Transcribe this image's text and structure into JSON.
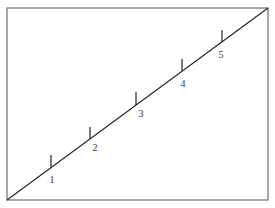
{
  "diagram": {
    "type": "number-line-diagonal",
    "frame": {
      "x": 7,
      "y": 8,
      "width": 261,
      "height": 192,
      "stroke": "#6e6e6e"
    },
    "line": {
      "x1": 7,
      "y1": 200,
      "x2": 268,
      "y2": 8,
      "stroke": "#222222"
    },
    "ticks": [
      {
        "label": "1",
        "x": 51,
        "y_top": 155,
        "y_bottom": 167,
        "label_x": 52,
        "label_y": 183
      },
      {
        "label": "2",
        "x": 90,
        "y_top": 127,
        "y_bottom": 139,
        "label_x": 95,
        "label_y": 151
      },
      {
        "label": "3",
        "x": 136,
        "y_top": 92,
        "y_bottom": 105,
        "label_x": 141,
        "label_y": 117
      },
      {
        "label": "4",
        "x": 182,
        "y_top": 59,
        "y_bottom": 71,
        "label_x": 183,
        "label_y": 87
      },
      {
        "label": "5",
        "x": 222,
        "y_top": 30,
        "y_bottom": 42,
        "label_x": 221,
        "label_y": 58
      }
    ]
  }
}
